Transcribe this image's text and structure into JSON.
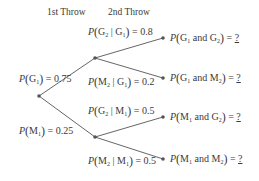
{
  "headers": {
    "first": "1st Throw",
    "second": "2nd Throw"
  },
  "colors": {
    "line": "#555555",
    "node": "#555555",
    "text": "#3a3a3a"
  },
  "nodes": {
    "root": {
      "x": 39,
      "y": 96
    },
    "g1": {
      "x": 95,
      "y": 58
    },
    "m1": {
      "x": 95,
      "y": 137
    },
    "g1g2": {
      "x": 163,
      "y": 38
    },
    "g1m2": {
      "x": 163,
      "y": 78
    },
    "m1g2": {
      "x": 163,
      "y": 117
    },
    "m1m2": {
      "x": 163,
      "y": 159
    }
  },
  "branches": {
    "g1": {
      "event": "G",
      "sub": "1",
      "value": "0.75"
    },
    "m1": {
      "event": "M",
      "sub": "1",
      "value": "0.25"
    },
    "g2_given_g1": {
      "event": "G",
      "sub": "2",
      "given": "G",
      "given_sub": "1",
      "value": "0.8"
    },
    "m2_given_g1": {
      "event": "M",
      "sub": "2",
      "given": "G",
      "given_sub": "1",
      "value": "0.2"
    },
    "g2_given_m1": {
      "event": "G",
      "sub": "2",
      "given": "M",
      "given_sub": "1",
      "value": "0.5"
    },
    "m2_given_m1": {
      "event": "M",
      "sub": "2",
      "given": "M",
      "given_sub": "1",
      "value": "0.5"
    }
  },
  "outcomes": {
    "g1g2": {
      "a": "G",
      "a_sub": "1",
      "b": "G",
      "b_sub": "2",
      "answer": "?"
    },
    "g1m2": {
      "a": "G",
      "a_sub": "1",
      "b": "M",
      "b_sub": "2",
      "answer": "?"
    },
    "m1g2": {
      "a": "M",
      "a_sub": "1",
      "b": "G",
      "b_sub": "2",
      "answer": "?"
    },
    "m1m2": {
      "a": "M",
      "a_sub": "1",
      "b": "M",
      "b_sub": "2",
      "answer": "?"
    }
  },
  "symbols": {
    "P": "P",
    "open": "(",
    "close": ")",
    "bar": "|",
    "and": "and",
    "eq": "="
  }
}
